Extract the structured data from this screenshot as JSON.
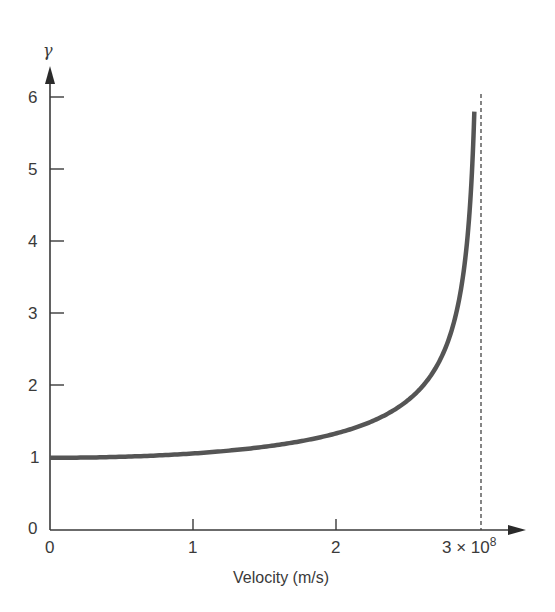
{
  "chart_data": {
    "type": "line",
    "title": "",
    "xlabel": "Velocity (m/s)",
    "ylabel": "γ",
    "x_ticks": [
      "0",
      "1",
      "2",
      "3 × 10⁸"
    ],
    "x_tick_values": [
      0,
      1,
      2,
      3
    ],
    "x_unit_multiplier": "10^8",
    "y_ticks": [
      "0",
      "1",
      "2",
      "3",
      "4",
      "5",
      "6"
    ],
    "y_tick_values": [
      0,
      1,
      2,
      3,
      4,
      5,
      6
    ],
    "xlim": [
      0,
      3.2
    ],
    "ylim": [
      0,
      6.3
    ],
    "grid": false,
    "legend": null,
    "annotations": [
      {
        "type": "vertical-dashed-line",
        "x": 3,
        "label": "speed of light c = 3 × 10⁸ m/s"
      }
    ],
    "series": [
      {
        "name": "Lorentz factor γ = 1/√(1 − v²/c²)",
        "x": [
          0,
          0.5,
          1.0,
          1.5,
          2.0,
          2.2,
          2.4,
          2.5,
          2.6,
          2.7,
          2.8,
          2.85,
          2.9,
          2.93,
          2.955
        ],
        "y": [
          1.0,
          1.01,
          1.06,
          1.15,
          1.34,
          1.47,
          1.67,
          1.81,
          2.0,
          2.29,
          2.79,
          3.2,
          3.9,
          4.65,
          5.4
        ]
      }
    ]
  },
  "labels": {
    "y_axis_symbol": "γ",
    "x_axis_title": "Velocity (m/s)",
    "x_tick_0": "0",
    "x_tick_1": "1",
    "x_tick_2": "2",
    "x_tick_3_base": "3 × 10",
    "x_tick_3_exp": "8",
    "y_tick_0": "0",
    "y_tick_1": "1",
    "y_tick_2": "2",
    "y_tick_3": "3",
    "y_tick_4": "4",
    "y_tick_5": "5",
    "y_tick_6": "6"
  },
  "colors": {
    "axis": "#3a3a3a",
    "curve": "#555555",
    "dashed": "#444444"
  }
}
